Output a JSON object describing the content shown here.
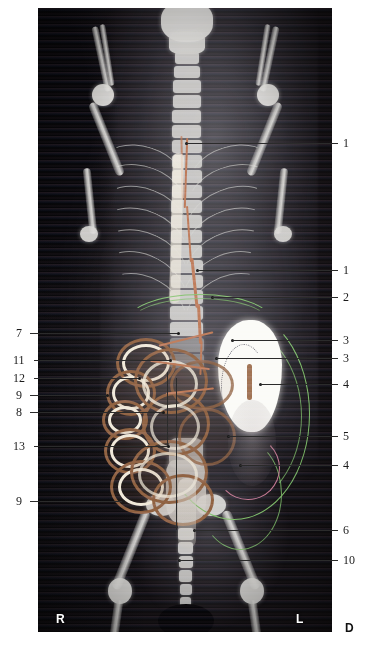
{
  "figure": {
    "panel": {
      "background_color": "#0a0808",
      "left": 38,
      "top": 8,
      "width": 294,
      "height": 624
    },
    "orientation_markers": [
      {
        "id": "right-marker",
        "label": "R",
        "color": "#ffffff",
        "position": "inside-bottom-left"
      },
      {
        "id": "left-marker",
        "label": "L",
        "color": "#ffffff",
        "position": "inside-bottom-right"
      },
      {
        "id": "dorsal-marker",
        "label": "D",
        "color": "#111111",
        "position": "outside-bottom-right"
      }
    ],
    "accent_colors": {
      "contour_green": "#7bbf63",
      "contour_pink": "#c4758f",
      "vessel_orange": "#b9714a",
      "contrast_brown": "#8a5a35",
      "bone_white": "#d9d8d4",
      "organ_white": "#fbfbf7",
      "leader_line": "#2b2b2b"
    },
    "labels_right": [
      {
        "id": "label-1-upper",
        "number": "1",
        "y": 143,
        "dot_x": 186,
        "dot_y": 143
      },
      {
        "id": "label-1-lower",
        "number": "1",
        "y": 270,
        "dot_x": 197,
        "dot_y": 270
      },
      {
        "id": "label-2",
        "number": "2",
        "y": 297,
        "dot_x": 212,
        "dot_y": 297
      },
      {
        "id": "label-3-upper",
        "number": "3",
        "y": 340,
        "dot_x": 232,
        "dot_y": 340
      },
      {
        "id": "label-3-lower",
        "number": "3",
        "y": 358,
        "dot_x": 216,
        "dot_y": 358
      },
      {
        "id": "label-4-upper",
        "number": "4",
        "y": 384,
        "dot_x": 260,
        "dot_y": 384
      },
      {
        "id": "label-5",
        "number": "5",
        "y": 436,
        "dot_x": 228,
        "dot_y": 436
      },
      {
        "id": "label-4-lower",
        "number": "4",
        "y": 465,
        "dot_x": 240,
        "dot_y": 465
      },
      {
        "id": "label-6",
        "number": "6",
        "y": 530,
        "dot_x": 194,
        "dot_y": 530
      },
      {
        "id": "label-10",
        "number": "10",
        "y": 560,
        "dot_x": 179,
        "dot_y": 560
      }
    ],
    "labels_left": [
      {
        "id": "label-7",
        "number": "7",
        "y": 333,
        "dot_x": 178,
        "dot_y": 333
      },
      {
        "id": "label-11",
        "number": "11",
        "y": 360,
        "dot_x": 170,
        "dot_y": 360
      },
      {
        "id": "label-12",
        "number": "12",
        "y": 378,
        "dot_x": 139,
        "dot_y": 378
      },
      {
        "id": "label-9-upper",
        "number": "9",
        "y": 395,
        "dot_x": 107,
        "dot_y": 395
      },
      {
        "id": "label-8",
        "number": "8",
        "y": 412,
        "dot_x": 163,
        "dot_y": 412
      },
      {
        "id": "label-13",
        "number": "13",
        "y": 446,
        "dot_x": 168,
        "dot_y": 446
      },
      {
        "id": "label-9-lower",
        "number": "9",
        "y": 501,
        "dot_x": 123,
        "dot_y": 501
      }
    ]
  }
}
